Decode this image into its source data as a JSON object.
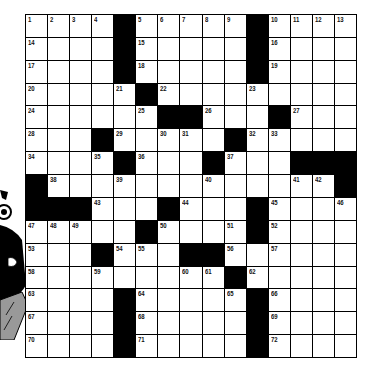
{
  "puzzle": {
    "rows": 15,
    "cols": 15,
    "colors": {
      "block": "#000000",
      "cell": "#ffffff",
      "line": "#000000"
    },
    "grid": [
      [
        "1",
        "2",
        "3",
        "4",
        "#",
        "5",
        "6",
        "7",
        "8",
        "9",
        "#",
        "10",
        "11",
        "12",
        "13"
      ],
      [
        "14",
        "",
        "",
        "",
        "#",
        "15",
        "",
        "",
        "",
        "",
        "#",
        "16",
        "",
        "",
        ""
      ],
      [
        "17",
        "",
        "",
        "",
        "#",
        "18",
        "",
        "",
        "",
        "",
        "#",
        "19",
        "",
        "",
        ""
      ],
      [
        "20",
        "",
        "",
        "",
        "21",
        "#",
        "22",
        "",
        "",
        "",
        "23",
        "",
        "",
        "",
        ""
      ],
      [
        "24",
        "",
        "",
        "",
        "",
        "25",
        "#",
        "#",
        "26",
        "",
        "",
        "#",
        "27",
        "",
        ""
      ],
      [
        "28",
        "",
        "",
        "#",
        "29",
        "",
        "30",
        "31",
        "",
        "#",
        "32",
        "33",
        "",
        "",
        ""
      ],
      [
        "34",
        "",
        "",
        "35",
        "#",
        "36",
        "",
        "",
        "#",
        "37",
        "",
        "",
        "#",
        "#",
        "#"
      ],
      [
        "#",
        "38",
        "",
        "",
        "39",
        "",
        "",
        "",
        "40",
        "",
        "",
        "",
        "41",
        "42",
        "#"
      ],
      [
        "#",
        "#",
        "#",
        "43",
        "",
        "",
        "#",
        "44",
        "",
        "",
        "#",
        "45",
        "",
        "",
        "46"
      ],
      [
        "47",
        "48",
        "49",
        "",
        "",
        "#",
        "50",
        "",
        "",
        "51",
        "#",
        "52",
        "",
        "",
        ""
      ],
      [
        "53",
        "",
        "",
        "#",
        "54",
        "55",
        "",
        "#",
        "#",
        "56",
        "",
        "57",
        "",
        "",
        ""
      ],
      [
        "58",
        "",
        "",
        "59",
        "",
        "",
        "",
        "60",
        "61",
        "#",
        "62",
        "",
        "",
        "",
        ""
      ],
      [
        "63",
        "",
        "",
        "",
        "#",
        "64",
        "",
        "",
        "",
        "65",
        "#",
        "66",
        "",
        "",
        ""
      ],
      [
        "67",
        "",
        "",
        "",
        "#",
        "68",
        "",
        "",
        "",
        "",
        "#",
        "69",
        "",
        "",
        ""
      ],
      [
        "70",
        "",
        "",
        "",
        "#",
        "71",
        "",
        "",
        "",
        "",
        "#",
        "72",
        "",
        "",
        ""
      ]
    ]
  },
  "illustration": {
    "icon": "cartoon-person-icon"
  }
}
